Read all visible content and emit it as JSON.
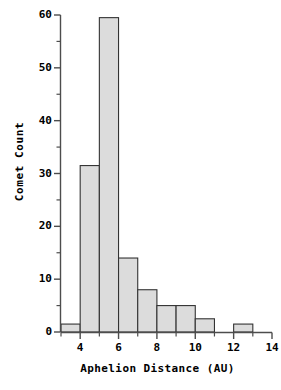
{
  "chart_data": {
    "type": "bar",
    "title": "",
    "subtitle": "",
    "xlabel": "Aphelion Distance (AU)",
    "ylabel": "Comet Count",
    "xlim": [
      3,
      14
    ],
    "ylim": [
      0,
      60
    ],
    "grid": false,
    "legend": null,
    "bin_width": 1,
    "categories": [
      "3-4",
      "4-5",
      "5-6",
      "6-7",
      "7-8",
      "8-9",
      "9-10",
      "10-11",
      "11-12",
      "12-13"
    ],
    "bin_edges": [
      3,
      4,
      5,
      6,
      7,
      8,
      9,
      10,
      11,
      12,
      13
    ],
    "values": [
      1.5,
      31.5,
      59.5,
      14,
      8,
      5,
      5,
      2.5,
      0,
      1.5
    ],
    "xticks": [
      4,
      6,
      8,
      10,
      12,
      14
    ],
    "xtick_labels": [
      "4",
      "6",
      "8",
      "10",
      "12",
      "14"
    ],
    "xminor_ticks": [
      3,
      5,
      7,
      9,
      11,
      13
    ],
    "yticks": [
      0,
      10,
      20,
      30,
      40,
      50,
      60
    ],
    "ytick_labels": [
      "0",
      "10",
      "20",
      "30",
      "40",
      "50",
      "60"
    ],
    "yminor_ticks": [
      5,
      15,
      25,
      35,
      45,
      55
    ],
    "bar_fill_color": "#dcdcdc",
    "bar_edge_color": "#333333",
    "axis_color": "#4d4d4d",
    "text_color": "#000000"
  }
}
